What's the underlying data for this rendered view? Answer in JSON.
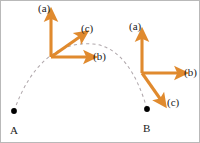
{
  "figure": {
    "background_color": "#ffffff",
    "border_color": "#b9b9b9",
    "axis_color": "#e08a2e",
    "trajectory_color": "#b0a8ac",
    "marker_color": "#000000",
    "text_color": "#1a1a1a"
  },
  "trajectory": {
    "name": "dashed-arc",
    "style": "dashed",
    "start_point": "A",
    "end_point": "B",
    "start_xy": [
      13,
      110
    ],
    "apex_xy": [
      92,
      43
    ],
    "end_xy": [
      146,
      108
    ]
  },
  "points": [
    {
      "id": "A",
      "label": "A",
      "x": 13,
      "y": 110,
      "label_x": 9,
      "label_y": 124
    },
    {
      "id": "B",
      "label": "B",
      "x": 146,
      "y": 108,
      "label_x": 142,
      "label_y": 122
    }
  ],
  "frames": [
    {
      "id": "left-frame",
      "origin_x": 50,
      "origin_y": 56,
      "axes": [
        {
          "id": "a",
          "label": "(a)",
          "dx": 0,
          "dy": -42,
          "label_x": 37,
          "label_y": 2
        },
        {
          "id": "c",
          "label": "(c)",
          "dx": 33,
          "dy": -23,
          "label_x": 80,
          "label_y": 22
        },
        {
          "id": "b",
          "label": "(b)",
          "dx": 40,
          "dy": 0,
          "label_x": 92,
          "label_y": 50
        }
      ]
    },
    {
      "id": "right-frame",
      "origin_x": 141,
      "origin_y": 72,
      "axes": [
        {
          "id": "a",
          "label": "(a)",
          "dx": 0,
          "dy": -38,
          "label_x": 128,
          "label_y": 20
        },
        {
          "id": "b",
          "label": "(b)",
          "dx": 40,
          "dy": 0,
          "label_x": 183,
          "label_y": 66
        },
        {
          "id": "c",
          "label": "(c)",
          "dx": 21,
          "dy": 30,
          "label_x": 166,
          "label_y": 96
        }
      ]
    }
  ]
}
